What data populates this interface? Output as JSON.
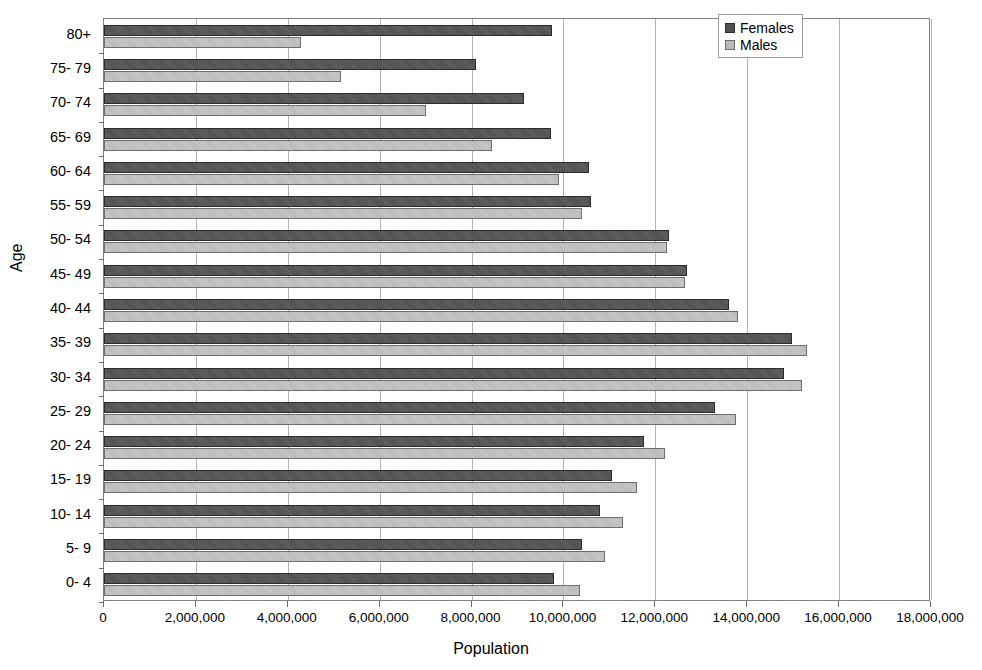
{
  "chart_data": {
    "type": "bar",
    "orientation": "horizontal",
    "title": "",
    "xlabel": "Population",
    "ylabel": "Age",
    "xlim": [
      0,
      18000000
    ],
    "xticks": [
      0,
      2000000,
      4000000,
      6000000,
      8000000,
      10000000,
      12000000,
      14000000,
      16000000,
      18000000
    ],
    "xtick_labels": [
      "0",
      "2,000,000",
      "4,000,000",
      "6,000,000",
      "8,000,000",
      "10,000,000",
      "12,000,000",
      "14,000,000",
      "16,000,000",
      "18,000,000"
    ],
    "grid": true,
    "grid_axis": "x",
    "legend_position": "top-right",
    "categories": [
      "80+",
      "75- 79",
      "70- 74",
      "65- 69",
      "60- 64",
      "55- 59",
      "50- 54",
      "45- 49",
      "40- 44",
      "35- 39",
      "30- 34",
      "25- 29",
      "20- 24",
      "15- 19",
      "10- 14",
      "5- 9",
      "0- 4"
    ],
    "series": [
      {
        "name": "Females",
        "color": "#4f4f4f",
        "values": [
          9760000,
          8100000,
          9150000,
          9720000,
          10550000,
          10600000,
          12300000,
          12700000,
          13600000,
          14980000,
          14800000,
          13300000,
          11750000,
          11050000,
          10800000,
          10400000,
          9800000
        ]
      },
      {
        "name": "Males",
        "color": "#b9b9b9",
        "values": [
          4280000,
          5150000,
          7000000,
          8450000,
          9900000,
          10400000,
          12250000,
          12650000,
          13800000,
          15300000,
          15200000,
          13750000,
          12200000,
          11600000,
          11300000,
          10900000,
          10350000
        ]
      }
    ]
  },
  "legend": {
    "items": [
      {
        "label": "Females",
        "swatch": "females"
      },
      {
        "label": "Males",
        "swatch": "males"
      }
    ]
  }
}
